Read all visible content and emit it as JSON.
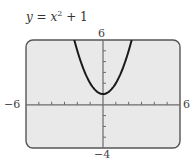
{
  "chart_data": {
    "type": "line",
    "equation": {
      "var": "y",
      "rhs_base": "x",
      "exponent": "2",
      "rhs_rest": "+ 1"
    },
    "xlabel": "",
    "ylabel": "",
    "xlim": [
      -6,
      6
    ],
    "ylim": [
      -4,
      6
    ],
    "grid": false,
    "x_ticks_step": 1,
    "y_ticks_step": 1,
    "window_labels": {
      "xmin": "−6",
      "xmax": "6",
      "ymin": "−4",
      "ymax": "6"
    },
    "series": [
      {
        "name": "y = x² + 1",
        "x": [
          -2.24,
          -2,
          -1.5,
          -1,
          -0.5,
          0,
          0.5,
          1,
          1.5,
          2,
          2.24
        ],
        "y": [
          6.0,
          5,
          3.25,
          2,
          1.25,
          1,
          1.25,
          2,
          3.25,
          5,
          6.0
        ]
      }
    ],
    "colors": {
      "screen_bg": "#e9e9e9",
      "frame": "#555555",
      "curve": "#1a1a1a",
      "axes": "#6a6a6a"
    }
  }
}
